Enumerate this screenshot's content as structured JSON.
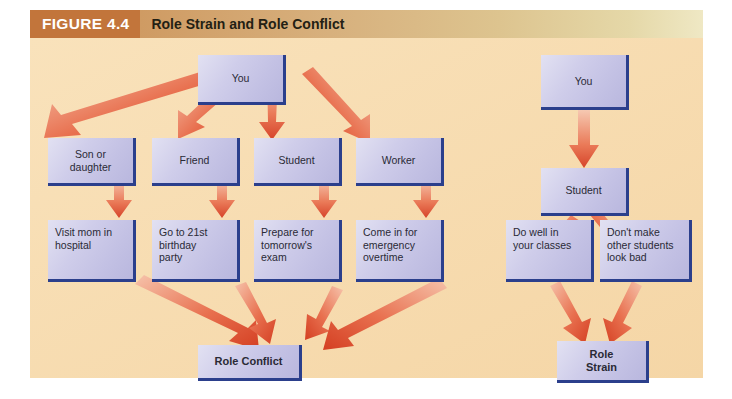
{
  "figure": {
    "number": "FIGURE 4.4",
    "title": "Role Strain and Role Conflict"
  },
  "colors": {
    "header_left": "#c2753b",
    "header_right": "#efe8c4",
    "canvas": "#f7dcb0",
    "node_fill": "#cfcdea",
    "node_border": "#2b3f8c",
    "arrow_light": "#f3a98c",
    "arrow_dark": "#d9442a",
    "text": "#2a2a36"
  },
  "diagrams": [
    {
      "name": "role-conflict",
      "outcome": "Role Conflict",
      "nodes": {
        "root": "You",
        "roles": [
          "Son or\ndaughter",
          "Friend",
          "Student",
          "Worker"
        ],
        "demands": [
          "Visit mom in\nhospital",
          "Go to 21st\nbirthday\nparty",
          "Prepare for\ntomorrow's\nexam",
          "Come in for\nemergency\novertime"
        ]
      }
    },
    {
      "name": "role-strain",
      "outcome": "Role\nStrain",
      "nodes": {
        "root": "You",
        "roles": [
          "Student"
        ],
        "demands": [
          "Do well in\nyour classes",
          "Don't make\nother students\nlook bad"
        ]
      }
    }
  ],
  "labels": {
    "you_left": "You",
    "you_right": "You",
    "son_or_daughter": "Son or\ndaughter",
    "friend": "Friend",
    "student_left": "Student",
    "worker": "Worker",
    "visit_mom": "Visit mom in\nhospital",
    "birthday": "Go to 21st\nbirthday\nparty",
    "exam": "Prepare for\ntomorrow's\nexam",
    "overtime": "Come in for\nemergency\novertime",
    "role_conflict": "Role Conflict",
    "student_right": "Student",
    "do_well": "Do well in\nyour classes",
    "dont_make": "Don't make\nother students\nlook bad",
    "role_strain": "Role\nStrain"
  }
}
